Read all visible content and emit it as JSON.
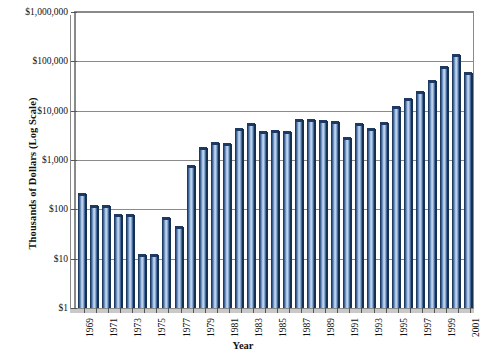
{
  "chart_data": {
    "type": "bar",
    "title": "",
    "xlabel": "Year",
    "ylabel": "Thousands of Dollars (Log Scale)",
    "yscale": "log",
    "ylim": [
      1,
      1000000
    ],
    "grid": true,
    "legend": "none",
    "ytick_labels": [
      "$1,000,000",
      "$100,000",
      "$10,000",
      "$1,000",
      "$100",
      "$10",
      "$1"
    ],
    "ytick_values": [
      1000000,
      100000,
      10000,
      1000,
      100,
      10,
      1
    ],
    "categories": [
      "1969",
      "1970",
      "1971",
      "1972",
      "1973",
      "1974",
      "1975",
      "1976",
      "1977",
      "1978",
      "1979",
      "1980",
      "1981",
      "1982",
      "1983",
      "1984",
      "1985",
      "1986",
      "1987",
      "1988",
      "1989",
      "1990",
      "1991",
      "1992",
      "1993",
      "1994",
      "1995",
      "1996",
      "1997",
      "1998",
      "1999",
      "2000",
      "2001"
    ],
    "xtick_labels_shown": [
      "1969",
      "1971",
      "1973",
      "1975",
      "1977",
      "1979",
      "1981",
      "1983",
      "1985",
      "1987",
      "1989",
      "1991",
      "1993",
      "1995",
      "1997",
      "1999",
      "2001"
    ],
    "values": [
      190,
      105,
      105,
      70,
      70,
      11,
      11,
      60,
      40,
      700,
      1600,
      2000,
      1900,
      3800,
      5000,
      3300,
      3600,
      3300,
      5800,
      6000,
      5600,
      5400,
      2500,
      5000,
      3800,
      5200,
      11000,
      16000,
      22000,
      37000,
      70000,
      120000,
      52000
    ],
    "series_name": "Thousands of Dollars",
    "bar_color": "#4a7ab5",
    "bar_edge_color": "#1d3a63",
    "grid_color": "#8a8a8a",
    "background_color": "#ffffff"
  }
}
